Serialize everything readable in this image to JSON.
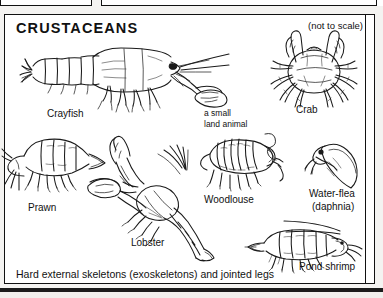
{
  "panel": {
    "title": "CRUSTACEANS",
    "scale_note": "(not to scale)",
    "caption": "Hard external skeletons (exoskeletons) and jointed legs"
  },
  "specimens": [
    {
      "id": "crayfish",
      "label": "Crayfish"
    },
    {
      "id": "crab",
      "label": "Crab"
    },
    {
      "id": "prawn",
      "label": "Prawn"
    },
    {
      "id": "lobster",
      "label": "Lobster"
    },
    {
      "id": "woodlouse",
      "label": "Woodlouse"
    },
    {
      "id": "waterflea",
      "label": "Water-flea",
      "label2": "(daphnia)"
    },
    {
      "id": "pondshrimp",
      "label": "Pond shrimp"
    }
  ],
  "annotations": {
    "woodlouse_note_line1": "a small",
    "woodlouse_note_line2": "land animal"
  },
  "colors": {
    "ink": "#1a1a1a",
    "paper": "#ffffff",
    "page": "#f4f3f1"
  }
}
